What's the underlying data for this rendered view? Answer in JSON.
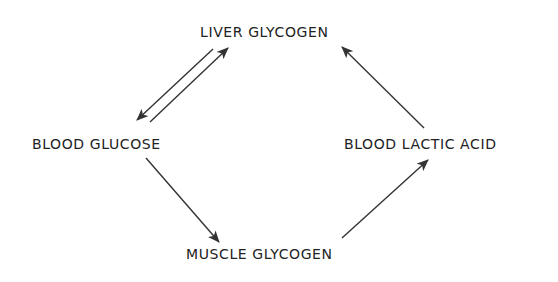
{
  "diagram": {
    "type": "cycle",
    "colors": {
      "text": "#222222",
      "arrow": "#333333",
      "background": "#ffffff"
    },
    "nodes": {
      "liver_glycogen": {
        "label": "LIVER GLYCOGEN"
      },
      "blood_glucose": {
        "label": "BLOOD GLUCOSE"
      },
      "blood_lactic_acid": {
        "label": "BLOOD LACTIC ACID"
      },
      "muscle_glycogen": {
        "label": "MUSCLE GLYCOGEN"
      }
    },
    "edges": [
      {
        "from": "liver_glycogen",
        "to": "blood_glucose"
      },
      {
        "from": "blood_glucose",
        "to": "liver_glycogen"
      },
      {
        "from": "blood_glucose",
        "to": "muscle_glycogen"
      },
      {
        "from": "muscle_glycogen",
        "to": "blood_lactic_acid"
      },
      {
        "from": "blood_lactic_acid",
        "to": "liver_glycogen"
      }
    ]
  }
}
